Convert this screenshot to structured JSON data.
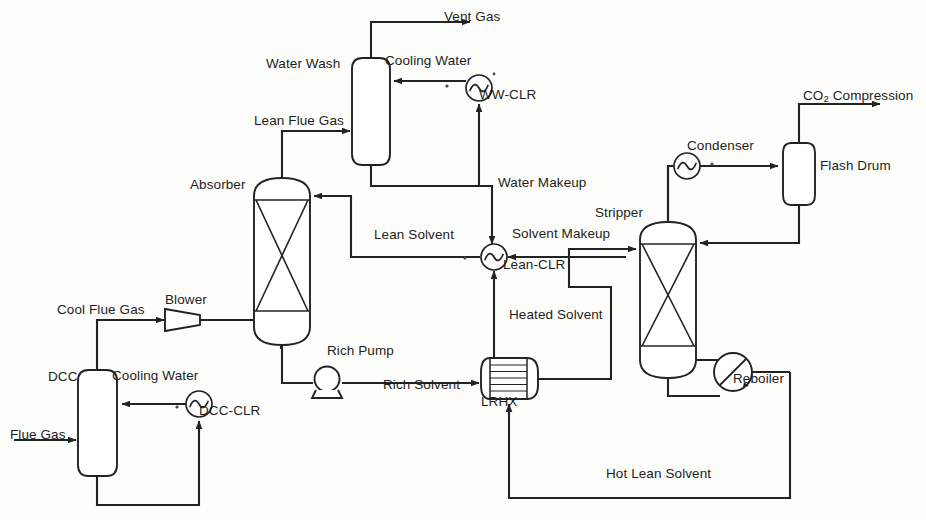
{
  "diagram": {
    "stroke_color": "#232326",
    "background_color": "#fdfdfc",
    "width": 926,
    "height": 520
  },
  "equipment": [
    {
      "id": "dcc",
      "label": "DCC",
      "type": "vessel-rounded",
      "x": 48,
      "y": 370
    },
    {
      "id": "blower",
      "label": "Blower",
      "type": "blower-trapezoid",
      "x": 165,
      "y": 293
    },
    {
      "id": "absorber",
      "label": "Absorber",
      "type": "packed-column",
      "x": 190,
      "y": 178
    },
    {
      "id": "waterwash",
      "label": "Water Wash",
      "type": "vessel-rounded",
      "x": 266,
      "y": 57
    },
    {
      "id": "stripper",
      "label": "Stripper",
      "type": "packed-column",
      "x": 595,
      "y": 206
    },
    {
      "id": "flashdrum",
      "label": "Flash Drum",
      "type": "vessel-rounded",
      "x": 820,
      "y": 159
    },
    {
      "id": "lrhx",
      "label": "LRHX",
      "type": "shell-and-tube",
      "x": 481,
      "y": 395
    }
  ],
  "exchangers": [
    {
      "id": "ww-clr",
      "label": "WW-CLR",
      "type": "cooler-circle",
      "x": 479,
      "y": 88
    },
    {
      "id": "lean-clr",
      "label": "Lean-CLR",
      "type": "cooler-circle",
      "x": 503,
      "y": 258
    },
    {
      "id": "dcc-clr",
      "label": "DCC-CLR",
      "type": "cooler-circle",
      "x": 199,
      "y": 404
    },
    {
      "id": "condenser",
      "label": "Condenser",
      "type": "cooler-circle",
      "x": 687,
      "y": 139
    },
    {
      "id": "reboiler",
      "label": "Reboiler",
      "type": "reboiler-circle",
      "x": 733,
      "y": 372
    }
  ],
  "pumps": [
    {
      "id": "rich-pump",
      "label": "Rich Pump",
      "type": "centrifugal-pump",
      "x": 327,
      "y": 344
    }
  ],
  "streams": [
    {
      "id": "flue-gas",
      "label": "Flue Gas",
      "x": 10,
      "y": 428
    },
    {
      "id": "cool-flue-gas",
      "label": "Cool Flue Gas",
      "x": 57,
      "y": 303
    },
    {
      "id": "lean-flue-gas",
      "label": "Lean Flue Gas",
      "x": 254,
      "y": 114
    },
    {
      "id": "vent-gas",
      "label": "Vent Gas",
      "x": 444,
      "y": 10
    },
    {
      "id": "cooling-water-ww",
      "label": "Cooling Water",
      "x": 385,
      "y": 54
    },
    {
      "id": "cooling-water-dcc",
      "label": "Cooling Water",
      "x": 112,
      "y": 369
    },
    {
      "id": "lean-solvent",
      "label": "Lean Solvent",
      "x": 374,
      "y": 228
    },
    {
      "id": "water-makeup",
      "label": "Water Makeup",
      "x": 498,
      "y": 176
    },
    {
      "id": "solvent-makeup",
      "label": "Solvent Makeup",
      "x": 512,
      "y": 227
    },
    {
      "id": "rich-solvent",
      "label": "Rich Solvent",
      "x": 383,
      "y": 378
    },
    {
      "id": "heated-solvent",
      "label": "Heated Solvent",
      "x": 509,
      "y": 308
    },
    {
      "id": "hot-lean-solvent",
      "label": "Hot Lean Solvent",
      "x": 606,
      "y": 467
    },
    {
      "id": "co2-compression",
      "label": "CO",
      "label_sub": "2",
      "label_tail": " Compression",
      "x": 803,
      "y": 89
    }
  ]
}
